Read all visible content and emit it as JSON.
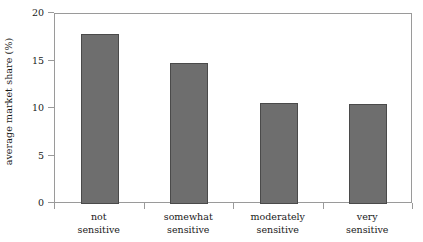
{
  "chart_data": {
    "type": "bar",
    "title": "",
    "xlabel": "",
    "ylabel": "average market share (%)",
    "categories": [
      "not sensitive",
      "somewhat sensitive",
      "moderately sensitive",
      "very sensitive"
    ],
    "category_lines": [
      [
        "not",
        "sensitive"
      ],
      [
        "somewhat",
        "sensitive"
      ],
      [
        "moderately",
        "sensitive"
      ],
      [
        "very",
        "sensitive"
      ]
    ],
    "values": [
      17.9,
      14.8,
      10.6,
      10.5
    ],
    "ylim": [
      0,
      20
    ],
    "yticks": [
      0,
      5,
      10,
      15,
      20
    ],
    "ytick_labels": [
      "0",
      "5",
      "10",
      "15",
      "20"
    ],
    "grid": false,
    "legend": false,
    "bar_color": "#6e6e6e",
    "bar_edge_color": "#4a4a4a",
    "axis_color": "#9a9a9a",
    "background": "#ffffff"
  }
}
